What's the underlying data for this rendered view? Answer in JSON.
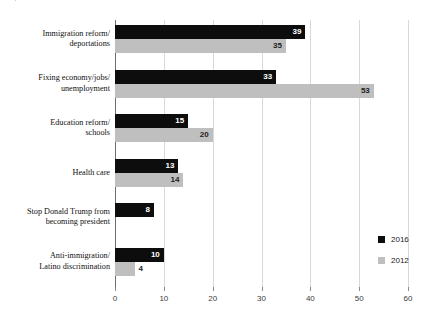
{
  "title_fragment": "Top issue",
  "chart_data": {
    "type": "bar",
    "orientation": "horizontal",
    "title": "",
    "xlabel": "",
    "ylabel": "",
    "xlim": [
      0,
      60
    ],
    "xticks": [
      0,
      10,
      20,
      30,
      40,
      50,
      60
    ],
    "xtick_labels": [
      "0",
      "10",
      "20",
      "30",
      "40",
      "50",
      "60"
    ],
    "grid": true,
    "grid_axis": "x",
    "legend_position": "right",
    "categories": [
      "Immigration reform/\ndeportations",
      "Fixing economy/jobs/\nunemployment",
      "Education reform/\nschools",
      "Health care",
      "Stop Donald Trump from\nbecoming president",
      "Anti-immigration/\nLatino discrimination"
    ],
    "category_lines": [
      [
        "Immigration reform/",
        "deportations"
      ],
      [
        "Fixing economy/jobs/",
        "unemployment"
      ],
      [
        "Education reform/",
        "schools"
      ],
      [
        "Health care"
      ],
      [
        "Stop Donald Trump from",
        "becoming president"
      ],
      [
        "Anti-immigration/",
        "Latino discrimination"
      ]
    ],
    "series": [
      {
        "name": "2016",
        "color": "#0d0d0d",
        "values": [
          39,
          33,
          15,
          13,
          8,
          10
        ],
        "labels": [
          "39",
          "33",
          "15",
          "13",
          "8",
          "10"
        ]
      },
      {
        "name": "2012",
        "color": "#bfbfbf",
        "values": [
          35,
          53,
          20,
          14,
          null,
          4
        ],
        "labels": [
          "35",
          "53",
          "20",
          "14",
          "",
          "4"
        ]
      }
    ]
  },
  "legend": {
    "items": [
      {
        "label": "2016",
        "color": "#0d0d0d"
      },
      {
        "label": "2012",
        "color": "#bfbfbf"
      }
    ]
  }
}
